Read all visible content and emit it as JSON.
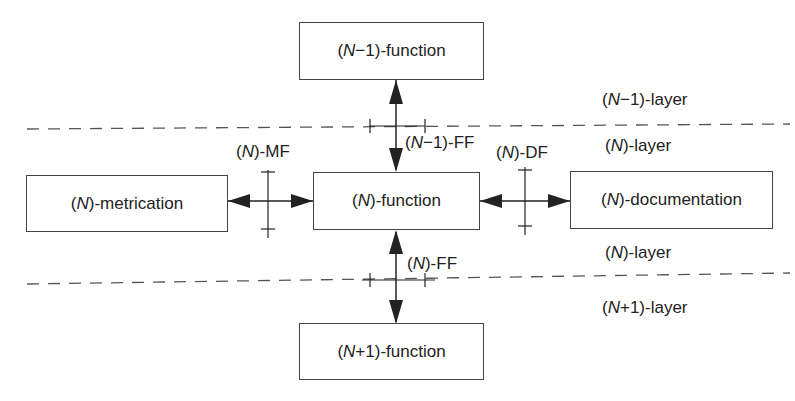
{
  "boxes": {
    "n_minus_1_function": {
      "prefix": "(",
      "var": "N",
      "suffix": "−1)-function"
    },
    "n_function": {
      "prefix": "(",
      "var": "N",
      "suffix": ")-function"
    },
    "n_plus_1_function": {
      "prefix": "(",
      "var": "N",
      "suffix": "+1)-function"
    },
    "n_metrication": {
      "prefix": "(",
      "var": "N",
      "suffix": ")-metrication"
    },
    "n_documentation": {
      "prefix": "(",
      "var": "N",
      "suffix": ")-documentation"
    }
  },
  "interfaces": {
    "n_minus_1_ff": {
      "prefix": "(",
      "var": "N",
      "suffix": "−1)-FF"
    },
    "n_ff": {
      "prefix": "(",
      "var": "N",
      "suffix": ")-FF"
    },
    "n_mf": {
      "prefix": "(",
      "var": "N",
      "suffix": ")-MF"
    },
    "n_df": {
      "prefix": "(",
      "var": "N",
      "suffix": ")-DF"
    }
  },
  "layers": {
    "n_minus_1_layer": {
      "prefix": "(",
      "var": "N",
      "suffix": "−1)-layer"
    },
    "n_layer_upper": {
      "prefix": "(",
      "var": "N",
      "suffix": ")-layer"
    },
    "n_layer_lower": {
      "prefix": "(",
      "var": "N",
      "suffix": ")-layer"
    },
    "n_plus_1_layer": {
      "prefix": "(",
      "var": "N",
      "suffix": "+1)-layer"
    }
  },
  "colors": {
    "line": "#333333",
    "text": "#222222"
  }
}
